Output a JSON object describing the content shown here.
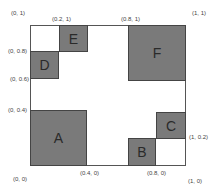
{
  "diagram": {
    "frame": {
      "x": 30,
      "y": 25,
      "w": 156,
      "h": 141,
      "border": "#555555"
    },
    "fill_color": "#7a7a7a",
    "rects": [
      {
        "label": "A",
        "x": 30,
        "y": 110,
        "w": 57,
        "h": 56,
        "coords": "(0,0)-(0.4,0.4)"
      },
      {
        "label": "B",
        "x": 128,
        "y": 138,
        "w": 28,
        "h": 28,
        "coords": "(0.8,0)-(1,0.2)"
      },
      {
        "label": "C",
        "x": 156,
        "y": 112,
        "w": 30,
        "h": 27,
        "coords": "(1,0.2) region"
      },
      {
        "label": "D",
        "x": 30,
        "y": 51,
        "w": 29,
        "h": 28,
        "coords": "(0,0.6)-(0.2,0.8)"
      },
      {
        "label": "E",
        "x": 59,
        "y": 25,
        "w": 29,
        "h": 27,
        "coords": "(0.2,0.8)-(0.4,1)"
      },
      {
        "label": "F",
        "x": 128,
        "y": 25,
        "w": 58,
        "h": 56,
        "coords": "(0.8,0.6)-(1,1)"
      }
    ],
    "coordinate_labels": [
      {
        "text": "(0, 1)",
        "x": 11,
        "y": 10
      },
      {
        "text": "(0.2, 1)",
        "x": 52,
        "y": 16
      },
      {
        "text": "(0.8, 1)",
        "x": 121,
        "y": 16
      },
      {
        "text": "(1, 1)",
        "x": 192,
        "y": 10
      },
      {
        "text": "(0, 0.8)",
        "x": 8,
        "y": 48
      },
      {
        "text": "(0, 0.6)",
        "x": 10,
        "y": 76
      },
      {
        "text": "(0, 0.4)",
        "x": 8,
        "y": 107
      },
      {
        "text": "(1, 0.2)",
        "x": 189,
        "y": 134
      },
      {
        "text": "(0, 0)",
        "x": 13,
        "y": 176
      },
      {
        "text": "(0.4, 0)",
        "x": 80,
        "y": 170
      },
      {
        "text": "(0.8, 0)",
        "x": 147,
        "y": 170
      },
      {
        "text": "(1, 0)",
        "x": 188,
        "y": 178
      }
    ]
  }
}
